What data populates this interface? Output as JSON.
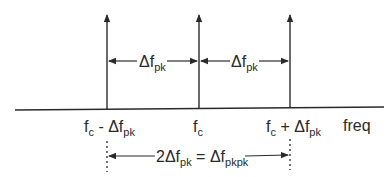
{
  "diagram": {
    "colors": {
      "line": "#2a2a2a",
      "background": "#ffffff"
    },
    "spectral_lines": [
      {
        "id": "lower",
        "x": 107
      },
      {
        "id": "carrier",
        "x": 199
      },
      {
        "id": "upper",
        "x": 290
      }
    ],
    "labels": {
      "delta_left": {
        "main": "Δf",
        "sub": "pk"
      },
      "delta_right": {
        "main": "Δf",
        "sub": "pk"
      },
      "lower_freq": {
        "pre": "f",
        "pre_sub": "c",
        "mid": " - Δf",
        "sub": "pk"
      },
      "carrier_freq": {
        "main": "f",
        "sub": "c"
      },
      "upper_freq": {
        "pre": "f",
        "pre_sub": "c",
        "mid": " + Δf",
        "sub": "pk"
      },
      "axis": "freq",
      "bottom_left": "2Δf",
      "bottom_left_sub": "pk",
      "bottom_eq": " = Δf",
      "bottom_right_sub": "pkpk"
    }
  }
}
